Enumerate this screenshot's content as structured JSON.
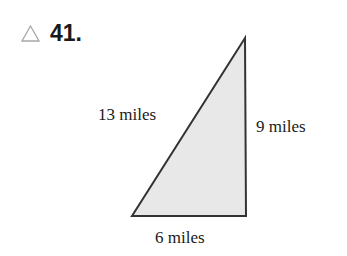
{
  "problem": {
    "marker_icon": "triangle-outline-icon",
    "number": "41."
  },
  "figure": {
    "shape": "right-triangle",
    "fill_color": "#e8e8e8",
    "stroke_color": "#333333",
    "sides": {
      "hypotenuse": "13 miles",
      "vertical": "9 miles",
      "base": "6 miles"
    }
  }
}
